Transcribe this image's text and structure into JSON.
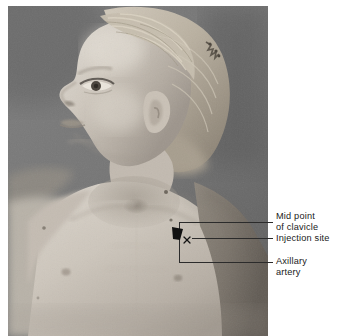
{
  "figure": {
    "kind": "clinical-photograph",
    "colors": {
      "background": "#ffffff",
      "photo_backdrop": "#6f6f6f",
      "annotation_line": "#2b2b2b",
      "label_text": "#1a1a1a",
      "marker_fill": "#111111"
    }
  },
  "annotations": {
    "markers": [
      {
        "name": "clavicle-midpoint-marker",
        "glyph": "filled-triangle",
        "x": 177,
        "y": 232
      },
      {
        "name": "injection-site-marker",
        "glyph": "x",
        "text": "x",
        "x": 187,
        "y": 240
      }
    ],
    "labels": [
      {
        "id": "clavicle",
        "lines": [
          "Mid point",
          "of clavicle"
        ],
        "text": "Mid point\nof clavicle",
        "leader_y": 222
      },
      {
        "id": "injection",
        "lines": [
          "Injection site"
        ],
        "text": "Injection site",
        "leader_y": 238
      },
      {
        "id": "axillary",
        "lines": [
          "Axillary",
          "artery"
        ],
        "text": "Axillary\nartery",
        "leader_y": 262
      }
    ]
  }
}
